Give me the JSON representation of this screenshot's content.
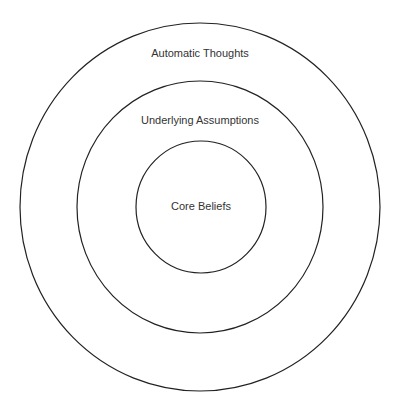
{
  "diagram": {
    "type": "concentric-circles",
    "layers": [
      {
        "label": "Automatic Thoughts",
        "level": "outer"
      },
      {
        "label": "Underlying Assumptions",
        "level": "middle"
      },
      {
        "label": "Core Beliefs",
        "level": "inner"
      }
    ],
    "colors": {
      "stroke": "#222222",
      "text": "#333333",
      "background": "#ffffff"
    }
  }
}
